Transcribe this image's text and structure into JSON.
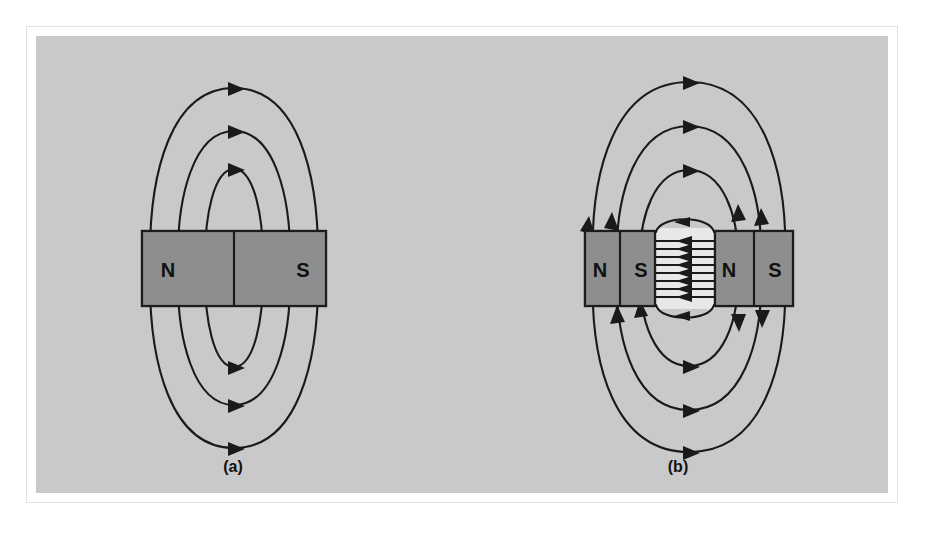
{
  "figure": {
    "kind": "physics-diagram",
    "topic": "Magnetic field lines of a bar magnet and of two bar magnets with an air gap",
    "background_color": "#c9c9c9",
    "page_color": "#ffffff",
    "frame_border_color": "#e2e2e2",
    "line_color": "#1a1a1a",
    "magnet_fill_color": "#8e8e8e",
    "gap_fill_color": "#e8e8e8"
  },
  "panels": [
    {
      "id": "a",
      "caption": "(a)",
      "caption_x": 233,
      "caption_y": 466,
      "description": "Single bar magnet with external dipole field loops",
      "magnets": [
        {
          "id": "a-magnet",
          "x": 142,
          "y": 231,
          "width": 184,
          "height": 75,
          "divider_x": 234,
          "poles": [
            {
              "label": "N",
              "x": 168,
              "y": 270
            },
            {
              "label": "S",
              "x": 303,
              "y": 270
            }
          ]
        }
      ],
      "external_loops": 3,
      "interior_dashed_lines": 8,
      "arrow_direction": "N to S, left to right outside the magnet"
    },
    {
      "id": "b",
      "caption": "(b)",
      "caption_x": 678,
      "caption_y": 466,
      "description": "Two bar magnets facing across an air gap; field in the gap is uniform and points left",
      "magnets": [
        {
          "id": "b-magnet-left",
          "x": 585,
          "y": 231,
          "width": 70,
          "height": 75,
          "divider_x": 620,
          "poles": [
            {
              "label": "N",
              "x": 600,
              "y": 270
            },
            {
              "label": "S",
              "x": 641,
              "y": 270
            }
          ]
        },
        {
          "id": "b-magnet-right",
          "x": 715,
          "y": 231,
          "width": 78,
          "height": 75,
          "divider_x": 754,
          "poles": [
            {
              "label": "N",
              "x": 729,
              "y": 270
            },
            {
              "label": "S",
              "x": 775,
              "y": 270
            }
          ]
        }
      ],
      "gap": {
        "x": 655,
        "y": 231,
        "width": 60,
        "height": 75,
        "line_count": 9,
        "arrow_direction": "left"
      },
      "external_loops": 3,
      "interior_dashed_lines": 8
    }
  ],
  "legend": {
    "solid_line": "external magnetic field line",
    "dashed_line": "field line inside magnet material",
    "arrowhead": "field direction"
  }
}
